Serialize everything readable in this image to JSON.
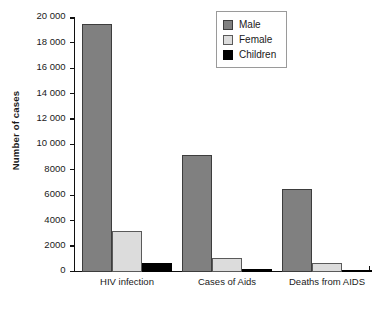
{
  "chart_data": {
    "type": "bar",
    "title": "",
    "xlabel": "",
    "ylabel": "Number of cases",
    "categories": [
      "HIV infection",
      "Cases of Aids",
      "Deaths from AIDS"
    ],
    "series": [
      {
        "name": "Male",
        "color": "#808080",
        "values": [
          19500,
          9200,
          6500
        ]
      },
      {
        "name": "Female",
        "color": "#dcdcdc",
        "values": [
          3200,
          1100,
          700
        ]
      },
      {
        "name": "Children",
        "color": "#000000",
        "values": [
          700,
          200,
          100
        ]
      }
    ],
    "ylim": [
      0,
      20000
    ],
    "ytick_values": [
      0,
      2000,
      4000,
      6000,
      8000,
      10000,
      12000,
      14000,
      16000,
      18000,
      20000
    ],
    "ytick_labels": [
      "0",
      "2000",
      "4000",
      "6000",
      "8000",
      "10 000",
      "12 000",
      "14 000",
      "16 000",
      "18 000",
      "20 000"
    ],
    "grid": false,
    "legend_position": "top-right"
  },
  "legend": {
    "items": [
      {
        "label": "Male"
      },
      {
        "label": "Female"
      },
      {
        "label": "Children"
      }
    ]
  }
}
